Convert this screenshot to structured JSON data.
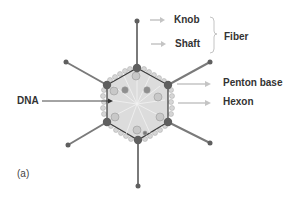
{
  "diagram": {
    "panel_label": "(a)",
    "labels": {
      "knob": "Knob",
      "shaft": "Shaft",
      "fiber": "Fiber",
      "penton_base": "Penton base",
      "hexon": "Hexon",
      "dna": "DNA"
    },
    "colors": {
      "fiber": "#7a7a7a",
      "penton": "#5f5f5f",
      "capsid_fill": "#dcdcdc",
      "capsid_edge": "#3a3a3a",
      "hexon": "#c8c8c8",
      "arrow_light": "#c4c4c4",
      "arrow_dark": "#333333",
      "text": "#333333"
    }
  }
}
